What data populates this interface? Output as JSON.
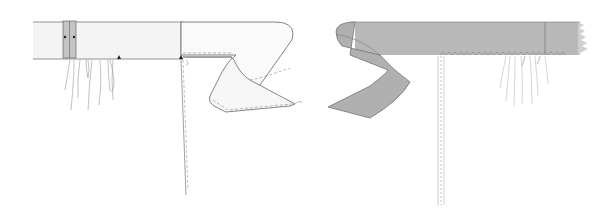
{
  "diagram": {
    "type": "sewing-illustration",
    "panels": [
      {
        "name": "left-panel",
        "view": "right side, light waistband with folded end",
        "waistband_fill": "#f4f4f4"
      },
      {
        "name": "right-panel",
        "view": "wrong side, grey waistband with folded end",
        "waistband_fill": "#b8b8b8"
      }
    ],
    "colors": {
      "outline": "#555555",
      "light_fill": "#f4f4f4",
      "dark_fill": "#b8b8b8",
      "tab_fill": "#c4c4c4",
      "gather_lines": "#9a9a9a",
      "stitch": "#888888"
    }
  }
}
